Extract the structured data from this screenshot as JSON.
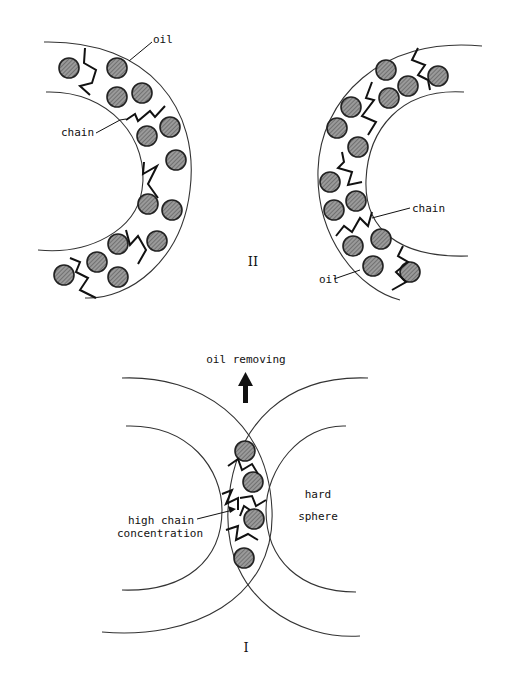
{
  "figure": {
    "panel_II": {
      "roman_label": "II",
      "left_shell": {
        "labels": {
          "oil": "oil",
          "chain": "chain"
        }
      },
      "right_shell": {
        "labels": {
          "oil": "oil",
          "chain": "chain"
        }
      }
    },
    "panel_I": {
      "roman_label": "I",
      "labels": {
        "oil_removing": "oil removing",
        "high_chain_line1": "high chain",
        "high_chain_line2": "concentration",
        "hard_line1": "hard",
        "hard_line2": "sphere"
      }
    },
    "colors": {
      "background": "#ffffff",
      "ink": "#111111",
      "oil_fill": "#8a8a8a"
    }
  }
}
